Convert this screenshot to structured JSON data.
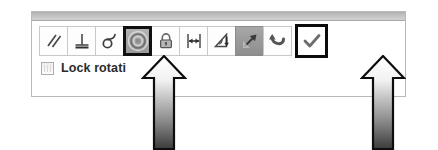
{
  "panel": {
    "title": "",
    "titlebar_color": "#c2c2c2",
    "border_color": "#b9b9b9"
  },
  "toolbar": {
    "name": "sketch-relations-toolbar",
    "buttons": [
      {
        "id": "parallel",
        "icon": "parallel-lines-icon",
        "label": "Parallel",
        "state": "normal"
      },
      {
        "id": "perpendicular",
        "icon": "perpendicular-icon",
        "label": "Perpendicular",
        "state": "normal"
      },
      {
        "id": "tangent",
        "icon": "tangent-icon",
        "label": "Tangent",
        "state": "normal"
      },
      {
        "id": "concentric",
        "icon": "concentric-circles-icon",
        "label": "Concentric",
        "state": "selected"
      },
      {
        "id": "fix",
        "icon": "padlock-icon",
        "label": "Fix",
        "state": "normal"
      },
      {
        "id": "equal-length",
        "icon": "linear-dimension-icon",
        "label": "Equal",
        "state": "normal"
      },
      {
        "id": "angle",
        "icon": "angular-dimension-icon",
        "label": "Angle",
        "state": "normal"
      },
      {
        "id": "symmetric",
        "icon": "diagonal-arrow-icon",
        "label": "Symmetric",
        "state": "pressed"
      },
      {
        "id": "undo",
        "icon": "undo-arrow-icon",
        "label": "Undo",
        "state": "normal"
      },
      {
        "id": "accept",
        "icon": "checkmark-icon",
        "label": "Accept",
        "state": "callout"
      }
    ]
  },
  "options": {
    "lock_rotation": {
      "label": "Lock rotati",
      "checked": false
    }
  },
  "annotations": {
    "arrows": [
      {
        "id": "arrow-left",
        "points_to": "concentric",
        "direction": "up",
        "fill": "gradient-white-to-black"
      },
      {
        "id": "arrow-right",
        "points_to": "accept",
        "direction": "up",
        "fill": "gradient-white-to-black"
      }
    ]
  },
  "colors": {
    "selection_border": "#101010",
    "pressed_background": "#9a9a9a",
    "panel_background": "#ffffff"
  }
}
